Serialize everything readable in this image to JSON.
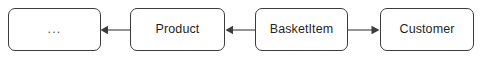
{
  "diagram": {
    "type": "entity-relationship-flow",
    "background_color": "#ffffff",
    "border_color": "#3c3c3c",
    "text_color": "#1f1f1f",
    "connector_color": "#3c3c3c",
    "nodes": [
      {
        "id": "more",
        "label": "...",
        "x": 8,
        "y": 8,
        "width": 93,
        "height": 43
      },
      {
        "id": "product",
        "label": "Product",
        "x": 130,
        "y": 8,
        "width": 95,
        "height": 43
      },
      {
        "id": "basketitem",
        "label": "BasketItem",
        "x": 255,
        "y": 8,
        "width": 93,
        "height": 43
      },
      {
        "id": "customer",
        "label": "Customer",
        "x": 380,
        "y": 8,
        "width": 94,
        "height": 43
      }
    ],
    "connectors": [
      {
        "id": "product-to-more",
        "from": "product",
        "to": "more",
        "direction": "left",
        "x1": 130,
        "x2": 101,
        "y": 30
      },
      {
        "id": "basketitem-to-product",
        "from": "basketitem",
        "to": "product",
        "direction": "left",
        "x1": 255,
        "x2": 226,
        "y": 30
      },
      {
        "id": "basketitem-to-customer",
        "from": "basketitem",
        "to": "customer",
        "direction": "right",
        "x1": 348,
        "x2": 379,
        "y": 30
      }
    ]
  }
}
